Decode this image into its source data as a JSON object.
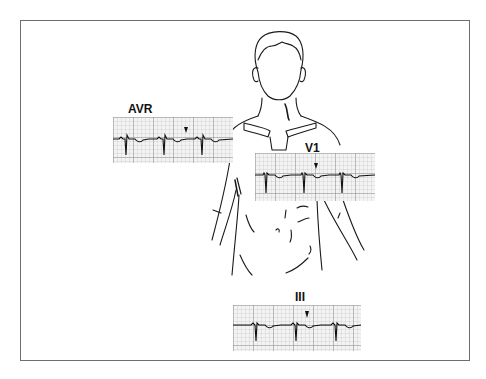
{
  "figure": {
    "type": "ECG lead placement illustration",
    "frame_color": "#6e6e6e",
    "line_color": "#1a1a1a",
    "grid_color": "#9a9a9a"
  },
  "leads": [
    {
      "name": "AVR",
      "label": "AVR",
      "position": "right shoulder",
      "marker": "arrowhead"
    },
    {
      "name": "V1",
      "label": "V1",
      "position": "right parasternal chest",
      "marker": "arrowhead"
    },
    {
      "name": "III",
      "label": "III",
      "position": "below torso",
      "marker": "arrowhead"
    }
  ]
}
